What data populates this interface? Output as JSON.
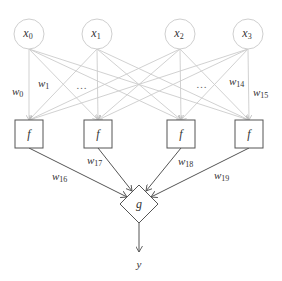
{
  "diagram": {
    "title": "",
    "colors": {
      "input_stroke": "#cfcfcf",
      "input_edge": "#cccccc",
      "hidden_stroke": "#555555",
      "output_edge": "#555555",
      "text": "#333333"
    },
    "inputs": [
      {
        "id": "x0",
        "base": "x",
        "sub": "0",
        "cx": 29,
        "cy": 34
      },
      {
        "id": "x1",
        "base": "x",
        "sub": "1",
        "cx": 97,
        "cy": 34
      },
      {
        "id": "x2",
        "base": "x",
        "sub": "2",
        "cx": 180,
        "cy": 34
      },
      {
        "id": "x3",
        "base": "x",
        "sub": "3",
        "cx": 248,
        "cy": 34
      }
    ],
    "hidden": [
      {
        "id": "f0",
        "label": "f",
        "cx": 29,
        "cy": 134
      },
      {
        "id": "f1",
        "label": "f",
        "cx": 98,
        "cy": 134
      },
      {
        "id": "f2",
        "label": "f",
        "cx": 181,
        "cy": 134
      },
      {
        "id": "f3",
        "label": "f",
        "cx": 249,
        "cy": 134
      }
    ],
    "output_node": {
      "id": "g",
      "label": "g",
      "cx": 139,
      "cy": 204
    },
    "output": {
      "label": "y"
    },
    "weight_labels": [
      {
        "id": "w0",
        "base": "w",
        "sub": "0",
        "x": 12,
        "y": 95
      },
      {
        "id": "w1",
        "base": "w",
        "sub": "1",
        "x": 38,
        "y": 87
      },
      {
        "id": "dots_left",
        "text": "…",
        "x": 76,
        "y": 89
      },
      {
        "id": "dots_right",
        "text": "…",
        "x": 196,
        "y": 88
      },
      {
        "id": "w14",
        "base": "w",
        "sub": "14",
        "x": 229,
        "y": 85
      },
      {
        "id": "w15",
        "base": "w",
        "sub": "15",
        "x": 253,
        "y": 96
      },
      {
        "id": "w16",
        "base": "w",
        "sub": "16",
        "x": 52,
        "y": 180
      },
      {
        "id": "w17",
        "base": "w",
        "sub": "17",
        "x": 87,
        "y": 164
      },
      {
        "id": "w18",
        "base": "w",
        "sub": "18",
        "x": 178,
        "y": 165
      },
      {
        "id": "w19",
        "base": "w",
        "sub": "19",
        "x": 214,
        "y": 179
      }
    ]
  }
}
